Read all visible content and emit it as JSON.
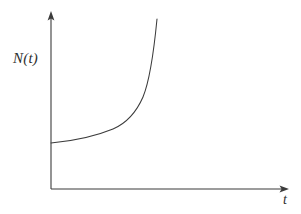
{
  "figure": {
    "background_color": "#ffffff",
    "line_color": "#3b3b3b",
    "width": 301,
    "height": 214
  },
  "axes": {
    "y_axis_label": "N(t)",
    "x_axis_label": "t",
    "y_axis_name": "y-axis",
    "x_axis_name": "x-axis",
    "origin": {
      "x": 51,
      "y": 189
    },
    "y_axis_tip": {
      "x": 51,
      "y": 12
    },
    "x_axis_tip": {
      "x": 288,
      "y": 189
    },
    "ticks": [],
    "tick_labels": [],
    "grid": false
  },
  "chart_data": {
    "type": "line",
    "title": "",
    "subtitle": "",
    "xlabel": "t",
    "ylabel": "N(t)",
    "grid": false,
    "legend": null,
    "legend_position": "none",
    "annotations": [],
    "axis_ticks_shown": false,
    "xlim": [
      0,
      1
    ],
    "ylim": [
      0,
      1
    ],
    "series": [
      {
        "name": "N(t)",
        "color": "#3b3b3b",
        "x": [
          0.0,
          0.05,
          0.1,
          0.15,
          0.2,
          0.25,
          0.3,
          0.35,
          0.4,
          0.45,
          0.5,
          0.55,
          0.6,
          0.65,
          0.7,
          0.75,
          0.8,
          0.85,
          0.9,
          0.95,
          1.0
        ],
        "y": [
          0.26,
          0.27,
          0.28,
          0.29,
          0.3,
          0.32,
          0.34,
          0.36,
          0.39,
          0.42,
          0.45,
          0.49,
          0.54,
          0.59,
          0.65,
          0.71,
          0.78,
          0.84,
          0.9,
          0.95,
          0.99
        ],
        "pixel_path": "M 51 143 C 74 141, 96 136, 113 129 C 127 123, 136 113, 143 97 C 150 80, 154 50, 157 19"
      }
    ]
  }
}
